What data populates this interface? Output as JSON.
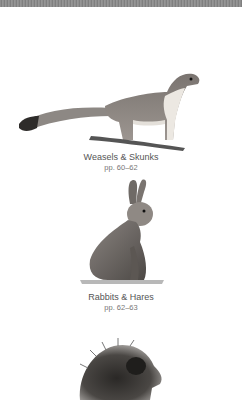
{
  "header_band": {
    "color": "#8a8a8a"
  },
  "entries": [
    {
      "title": "Weasels & Skunks",
      "pages": "pp. 60–62",
      "illustration": "weasel-illustration"
    },
    {
      "title": "Rabbits & Hares",
      "pages": "pp. 62–63",
      "illustration": "rabbit-illustration"
    },
    {
      "title": "",
      "pages": "",
      "illustration": "porcupine-illustration"
    }
  ]
}
